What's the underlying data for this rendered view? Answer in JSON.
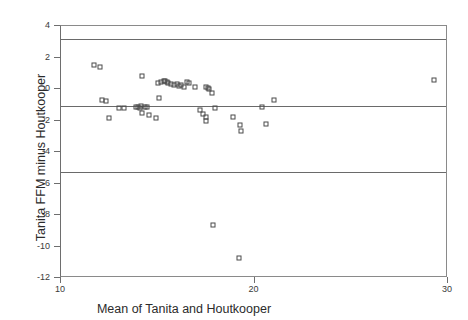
{
  "chart_data": {
    "type": "scatter",
    "title": "",
    "xlabel": "Mean of Tanita and Houtkooper",
    "ylabel": "Tanita FFM minus Houtkooper",
    "xlim": [
      10,
      30
    ],
    "ylim": [
      -12,
      4
    ],
    "xticks": [
      10,
      20,
      30
    ],
    "xtick_labels": [
      "10",
      "20",
      "30"
    ],
    "yticks": [
      4,
      2,
      0,
      -2,
      -4,
      -6,
      -8,
      -10,
      -12
    ],
    "ytick_labels": [
      "4",
      "2",
      "0",
      "-2",
      "-4",
      "-6",
      "-8",
      "-10",
      "-12"
    ],
    "grid": false,
    "legend": "none",
    "marker": "open-square",
    "marker_color": "#4b4b4b",
    "reference_lines": [
      {
        "name": "upper-limit-of-agreement",
        "y": 3.2,
        "style": "solid",
        "color": "#6a6a6a"
      },
      {
        "name": "mean-bias",
        "y": -1.1,
        "style": "solid",
        "color": "#6a6a6a"
      },
      {
        "name": "lower-limit-of-agreement",
        "y": -5.25,
        "style": "solid",
        "color": "#6a6a6a"
      }
    ],
    "points": [
      {
        "x": 11.7,
        "y": 1.55
      },
      {
        "x": 12.0,
        "y": 1.4
      },
      {
        "x": 12.1,
        "y": -0.7
      },
      {
        "x": 12.35,
        "y": -0.75
      },
      {
        "x": 12.5,
        "y": -1.85
      },
      {
        "x": 13.0,
        "y": -1.2
      },
      {
        "x": 13.25,
        "y": -1.2
      },
      {
        "x": 13.9,
        "y": -1.15
      },
      {
        "x": 14.0,
        "y": -1.15
      },
      {
        "x": 14.1,
        "y": -1.2
      },
      {
        "x": 14.15,
        "y": -1.1
      },
      {
        "x": 14.2,
        "y": -1.5
      },
      {
        "x": 14.35,
        "y": -1.15
      },
      {
        "x": 14.45,
        "y": -1.15
      },
      {
        "x": 14.2,
        "y": 0.8
      },
      {
        "x": 14.55,
        "y": -1.65
      },
      {
        "x": 14.9,
        "y": -1.85
      },
      {
        "x": 15.0,
        "y": 0.4
      },
      {
        "x": 15.15,
        "y": 0.45
      },
      {
        "x": 15.3,
        "y": 0.5
      },
      {
        "x": 15.4,
        "y": 0.5
      },
      {
        "x": 15.5,
        "y": 0.45
      },
      {
        "x": 15.55,
        "y": 0.35
      },
      {
        "x": 15.7,
        "y": 0.3
      },
      {
        "x": 15.85,
        "y": 0.25
      },
      {
        "x": 16.0,
        "y": 0.3
      },
      {
        "x": 16.1,
        "y": 0.2
      },
      {
        "x": 16.2,
        "y": 0.25
      },
      {
        "x": 16.35,
        "y": 0.15
      },
      {
        "x": 16.5,
        "y": 0.45
      },
      {
        "x": 16.6,
        "y": 0.4
      },
      {
        "x": 15.05,
        "y": -0.6
      },
      {
        "x": 16.9,
        "y": 0.1
      },
      {
        "x": 17.5,
        "y": 0.1
      },
      {
        "x": 17.6,
        "y": 0.05
      },
      {
        "x": 17.65,
        "y": 0.0
      },
      {
        "x": 17.8,
        "y": -0.25
      },
      {
        "x": 17.2,
        "y": -1.35
      },
      {
        "x": 17.35,
        "y": -1.6
      },
      {
        "x": 17.5,
        "y": -1.75
      },
      {
        "x": 17.5,
        "y": -2.05
      },
      {
        "x": 17.95,
        "y": -1.2
      },
      {
        "x": 17.85,
        "y": -8.65
      },
      {
        "x": 18.9,
        "y": -1.75
      },
      {
        "x": 19.25,
        "y": -2.3
      },
      {
        "x": 19.3,
        "y": -2.65
      },
      {
        "x": 19.2,
        "y": -10.75
      },
      {
        "x": 20.4,
        "y": -1.15
      },
      {
        "x": 20.6,
        "y": -2.25
      },
      {
        "x": 21.0,
        "y": -0.7
      },
      {
        "x": 29.3,
        "y": 0.6
      }
    ]
  }
}
